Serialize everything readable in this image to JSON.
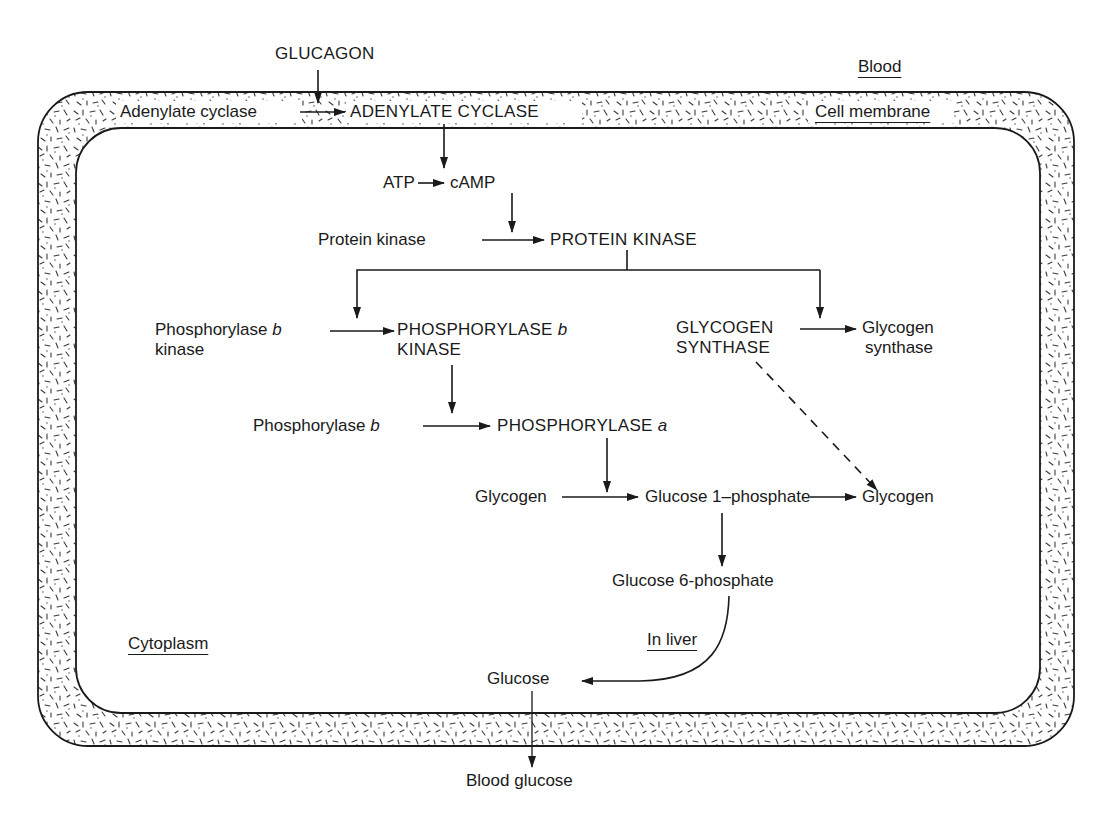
{
  "diagram": {
    "type": "signal-transduction-pathway",
    "colors": {
      "ink": "#1a1a1a",
      "background": "#ffffff",
      "membrane_stipple": "#3a3a3a"
    },
    "regions": {
      "blood": "Blood",
      "cell_membrane": "Cell membrane",
      "cytoplasm": "Cytoplasm",
      "in_liver": "In liver"
    },
    "nodes": {
      "glucagon": "GLUCAGON",
      "adenylate_cyclase_inactive": "Adenylate cyclase",
      "adenylate_cyclase_active": "ADENYLATE CYCLASE",
      "atp": "ATP",
      "camp": "cAMP",
      "protein_kinase_inactive": "Protein kinase",
      "protein_kinase_active": "PROTEIN KINASE",
      "phosphorylase_b_kinase_inactive": {
        "line1_prefix": "Phosphorylase ",
        "line1_italic": "b",
        "line2": "kinase"
      },
      "phosphorylase_b_kinase_active": {
        "line1_prefix": "PHOSPHORYLASE ",
        "line1_italic": "b",
        "line2": "KINASE"
      },
      "glycogen_synthase_active": {
        "line1": "GLYCOGEN",
        "line2": "SYNTHASE"
      },
      "glycogen_synthase_inactive": {
        "line1": "Glycogen",
        "line2": "synthase"
      },
      "phosphorylase_b": {
        "prefix": "Phosphorylase ",
        "italic": "b"
      },
      "phosphorylase_a": {
        "prefix": "PHOSPHORYLASE ",
        "italic": "a"
      },
      "glycogen_substrate": "Glycogen",
      "glucose_1_phosphate": "Glucose 1–phosphate",
      "glycogen_product": "Glycogen",
      "glucose_6_phosphate": "Glucose 6-phosphate",
      "glucose": "Glucose",
      "blood_glucose": "Blood glucose"
    },
    "edges": [
      {
        "from": "GLUCAGON",
        "to": "Adenylate cyclase → ADENYLATE CYCLASE",
        "style": "solid",
        "kind": "activates"
      },
      {
        "from": "Adenylate cyclase",
        "to": "ADENYLATE CYCLASE",
        "style": "solid"
      },
      {
        "from": "ADENYLATE CYCLASE",
        "to": "ATP → cAMP",
        "style": "solid",
        "kind": "catalyses"
      },
      {
        "from": "ATP",
        "to": "cAMP",
        "style": "solid"
      },
      {
        "from": "cAMP",
        "to": "Protein kinase → PROTEIN KINASE",
        "style": "solid",
        "kind": "activates"
      },
      {
        "from": "Protein kinase",
        "to": "PROTEIN KINASE",
        "style": "solid"
      },
      {
        "from": "PROTEIN KINASE",
        "to": "Phosphorylase b kinase → PHOSPHORYLASE b KINASE",
        "style": "solid"
      },
      {
        "from": "PROTEIN KINASE",
        "to": "GLYCOGEN SYNTHASE → Glycogen synthase",
        "style": "solid"
      },
      {
        "from": "Phosphorylase b kinase",
        "to": "PHOSPHORYLASE b KINASE",
        "style": "solid"
      },
      {
        "from": "GLYCOGEN SYNTHASE",
        "to": "Glycogen synthase",
        "style": "solid"
      },
      {
        "from": "PHOSPHORYLASE b KINASE",
        "to": "Phosphorylase b → PHOSPHORYLASE a",
        "style": "solid"
      },
      {
        "from": "Phosphorylase b",
        "to": "PHOSPHORYLASE a",
        "style": "solid"
      },
      {
        "from": "PHOSPHORYLASE a",
        "to": "Glycogen → Glucose 1-phosphate",
        "style": "solid"
      },
      {
        "from": "Glycogen",
        "to": "Glucose 1-phosphate",
        "style": "solid"
      },
      {
        "from": "GLYCOGEN SYNTHASE",
        "to": "Glucose 1-phosphate → Glycogen",
        "style": "dashed"
      },
      {
        "from": "Glucose 1-phosphate",
        "to": "Glycogen",
        "style": "solid"
      },
      {
        "from": "Glucose 1-phosphate",
        "to": "Glucose 6-phosphate",
        "style": "solid"
      },
      {
        "from": "Glucose 6-phosphate",
        "to": "Glucose",
        "style": "solid-curved",
        "note": "In liver"
      },
      {
        "from": "Glucose",
        "to": "Blood glucose",
        "style": "solid",
        "crosses": "Cell membrane"
      }
    ]
  }
}
